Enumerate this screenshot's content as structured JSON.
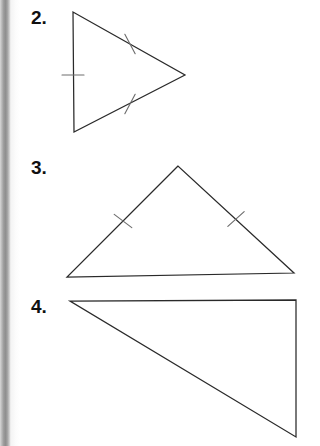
{
  "page": {
    "width": 320,
    "height": 446,
    "background_color": "#ffffff",
    "scan_artifact": "book-binding-shadow-left-edge",
    "stroke_color": "#2a2a2a",
    "tick_color": "#6e6e6e",
    "label_color": "#101010"
  },
  "figures": [
    {
      "number": "2.",
      "shape": "isosceles-triangle-pointing-right",
      "vertices": [
        [
          73,
          12
        ],
        [
          74,
          132
        ],
        [
          185,
          75
        ]
      ],
      "label_position": [
        31,
        8
      ],
      "congruence_ticks": [
        {
          "side": "left-vertical",
          "count": 1,
          "midpoint": [
            73,
            75
          ],
          "angle_deg": 0
        },
        {
          "side": "upper-right-slant",
          "count": 1,
          "midpoint": [
            130,
            44
          ],
          "angle_deg": 62
        },
        {
          "side": "lower-right-slant",
          "count": 1,
          "midpoint": [
            130,
            104
          ],
          "angle_deg": -62
        }
      ]
    },
    {
      "number": "3.",
      "shape": "isosceles-triangle-apex-up",
      "vertices": [
        [
          178,
          166
        ],
        [
          67,
          277
        ],
        [
          294,
          273
        ]
      ],
      "label_position": [
        31,
        158
      ],
      "congruence_ticks": [
        {
          "side": "left-slant",
          "count": 1,
          "midpoint": [
            123,
            221
          ],
          "angle_deg": 37
        },
        {
          "side": "right-slant",
          "count": 1,
          "midpoint": [
            236,
            219
          ],
          "angle_deg": -42
        }
      ]
    },
    {
      "number": "4.",
      "shape": "right-triangle",
      "vertices": [
        [
          70,
          301
        ],
        [
          296,
          300
        ],
        [
          296,
          437
        ]
      ],
      "label_position": [
        31,
        297
      ],
      "congruence_ticks": []
    }
  ]
}
